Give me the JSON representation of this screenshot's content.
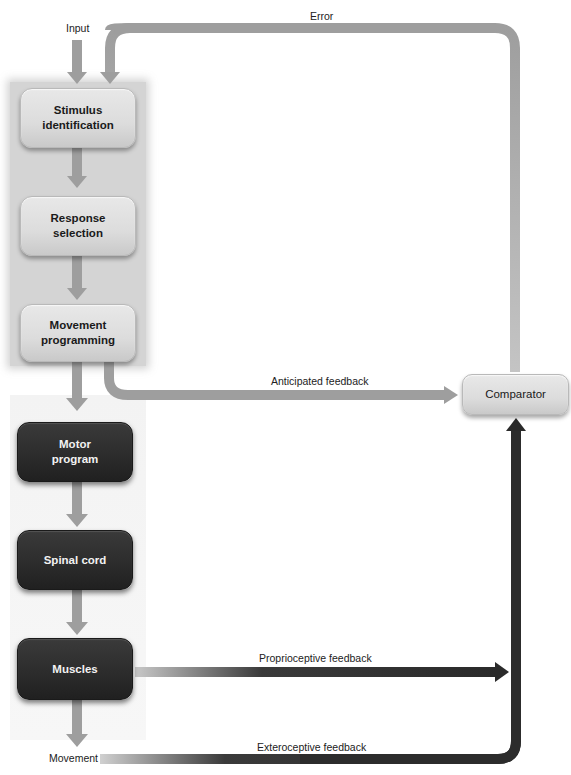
{
  "diagram": {
    "colors": {
      "light_arrow": "#9e9e9e",
      "dark_arrow": "#2e2e2e",
      "panel": "#d4d4d4",
      "light_box": "#dcdcdc",
      "dark_box": "#2b2b2b"
    },
    "labels": {
      "input": "Input",
      "error": "Error",
      "anticipated": "Anticipated feedback",
      "proprioceptive": "Proprioceptive feedback",
      "exteroceptive": "Exteroceptive feedback",
      "movement": "Movement"
    },
    "boxes": {
      "stimulus": {
        "line1": "Stimulus",
        "line2": "identification"
      },
      "response": {
        "line1": "Response",
        "line2": "selection"
      },
      "programming": {
        "line1": "Movement",
        "line2": "programming"
      },
      "motor": {
        "line1": "Motor",
        "line2": "program"
      },
      "spinal": {
        "line1": "Spinal cord"
      },
      "muscles": {
        "line1": "Muscles"
      },
      "comparator": {
        "line1": "Comparator"
      }
    }
  }
}
